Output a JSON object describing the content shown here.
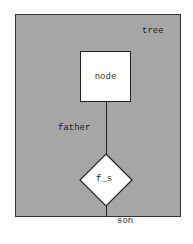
{
  "diagram": {
    "container": {
      "label": "tree",
      "fill": "#a6a6a6"
    },
    "node": {
      "label": "node"
    },
    "relation": {
      "label": "f_s"
    },
    "edges": [
      {
        "label": "father",
        "from": "node",
        "to": "f_s"
      },
      {
        "label": "son",
        "from": "f_s",
        "to": "container-bottom"
      }
    ]
  }
}
